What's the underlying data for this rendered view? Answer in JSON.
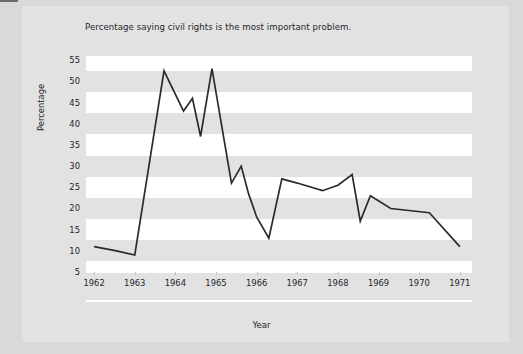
{
  "figure": {
    "title": "Percentage saying civil rights is the most important problem.",
    "margin_artifacts": {
      "line_1": "r",
      "line_2": "s"
    }
  },
  "chart_data": {
    "type": "line",
    "title": "Percentage saying civil rights is the most important problem.",
    "xlabel": "Year",
    "ylabel": "Percentage",
    "ylim": [
      5,
      56
    ],
    "xlim": [
      1961.8,
      1971.3
    ],
    "yticks": [
      5,
      10,
      15,
      20,
      25,
      30,
      35,
      40,
      45,
      50,
      55
    ],
    "xticks": [
      1962,
      1963,
      1964,
      1965,
      1966,
      1967,
      1968,
      1969,
      1970,
      1971
    ],
    "xtick_labels": [
      "1962",
      "1963",
      "1964",
      "1965",
      "1966",
      "1967",
      "1968",
      "1969",
      "1970",
      "1971"
    ],
    "ytick_labels": [
      "5",
      "10",
      "15",
      "20",
      "25",
      "30",
      "35",
      "40",
      "45",
      "50",
      "55"
    ],
    "grid": "alternating horizontal bands",
    "legend": "none",
    "line_color": "#2b2b2b",
    "band_color": "#ffffff",
    "plot_background": "#e2e2e2",
    "series": [
      {
        "name": "Civil rights most important problem",
        "x": [
          1962.0,
          1962.55,
          1963.0,
          1963.72,
          1964.2,
          1964.42,
          1964.62,
          1964.9,
          1965.38,
          1965.62,
          1965.8,
          1966.0,
          1966.3,
          1966.62,
          1967.0,
          1967.62,
          1968.0,
          1968.35,
          1968.55,
          1968.8,
          1969.3,
          1970.25,
          1971.0
        ],
        "y": [
          11.0,
          10.0,
          9.0,
          52.5,
          43.0,
          46.0,
          37.0,
          53.0,
          26.0,
          30.0,
          23.5,
          18.0,
          13.0,
          27.0,
          26.0,
          24.2,
          25.5,
          28.0,
          17.0,
          23.0,
          20.0,
          19.0,
          11.0
        ]
      }
    ]
  }
}
